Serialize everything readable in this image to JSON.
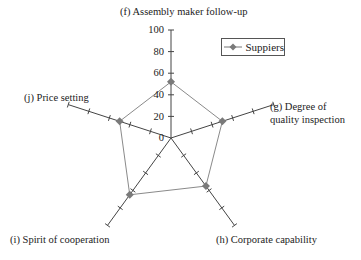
{
  "chart_data": {
    "type": "radar",
    "title": "",
    "categories": [
      "(f) Assembly maker follow-up",
      "(g) Degree of quality inspection",
      "(h) Corporate capability",
      "(i) Spirit of cooperation",
      "(j) Price setting"
    ],
    "series": [
      {
        "name": "Suppiers",
        "values": [
          52,
          50,
          55,
          65,
          50
        ]
      }
    ],
    "radial_range": [
      0,
      100
    ],
    "radial_ticks": [
      0,
      20,
      40,
      60,
      80,
      100
    ],
    "legend_position": "upper right",
    "colors": {
      "series": "#8a8a8a",
      "marker": "#7a7a7a",
      "axis": "#444444"
    }
  },
  "labels": {
    "f": "(f) Assembly maker follow-up",
    "g1": "(g) Degree of",
    "g2": "quality inspection",
    "h": "(h) Corporate capability",
    "i": "(i) Spirit of cooperation",
    "j": "(j) Price setting"
  },
  "ticks": [
    "100",
    "80",
    "60",
    "40",
    "20",
    "0"
  ],
  "legend": {
    "label": "Suppiers"
  }
}
